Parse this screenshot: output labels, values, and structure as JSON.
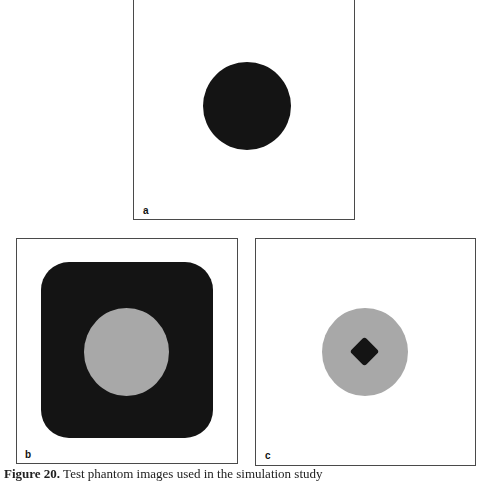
{
  "figure": {
    "panels": [
      {
        "id": "a",
        "label": "a"
      },
      {
        "id": "b",
        "label": "b"
      },
      {
        "id": "c",
        "label": "c"
      }
    ],
    "colors": {
      "dark": "#141414",
      "gray": "#a8a8a8",
      "border": "#4a4a4a",
      "background": "#ffffff"
    },
    "caption": {
      "number": "Figure 20.",
      "text": "Test phantom images used in the simulation study"
    }
  }
}
